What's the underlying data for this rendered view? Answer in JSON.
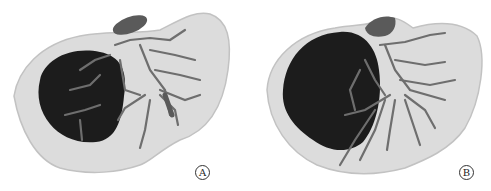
{
  "figure": {
    "panels": [
      {
        "id": "A",
        "label": "A",
        "description": "3D liver reconstruction with dark tumor mass in right lobe and vessel branches"
      },
      {
        "id": "B",
        "label": "B",
        "description": "3D liver reconstruction, alternate view, large dark tumor mass with dense vessel network"
      }
    ],
    "colors": {
      "liver_parenchyma": "#dcdcdc",
      "liver_outline": "#c2c2c2",
      "tumor": "#1c1c1c",
      "vessels": "#6e6e6e",
      "gallbladder": "#5a5a5a"
    }
  }
}
